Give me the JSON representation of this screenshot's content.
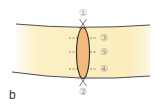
{
  "figure": {
    "panel_label": "b",
    "markers": {
      "top": "①",
      "bottom": "②",
      "upper": "③",
      "middle": "⑤",
      "lower": "④"
    }
  },
  "colors": {
    "band_fill": "#fbefc0",
    "band_edge": "#3a3a3a",
    "ellipse_fill": "#f3b97a",
    "ellipse_edge": "#2b2b2b",
    "dash": "#6e6a4a",
    "label": "#8a8a8a"
  }
}
